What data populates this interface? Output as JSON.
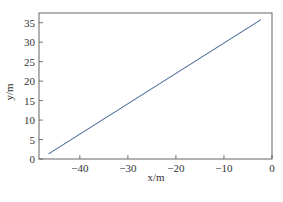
{
  "chart_data": {
    "type": "line",
    "title": "",
    "xlabel": "x/m",
    "ylabel": "y/m",
    "xlim": [
      -48.5,
      0
    ],
    "ylim": [
      0,
      37.5
    ],
    "xticks": [
      -40,
      -30,
      -20,
      -10,
      0
    ],
    "xtick_labels": [
      "−40",
      "−30",
      "−20",
      "−10",
      "0"
    ],
    "yticks": [
      0,
      5,
      10,
      15,
      20,
      25,
      30,
      35
    ],
    "ytick_labels": [
      "0",
      "5",
      "10",
      "15",
      "20",
      "25",
      "30",
      "35"
    ],
    "grid": false,
    "legend": null,
    "series": [
      {
        "name": "trajectory",
        "color": "#4a6a9a",
        "x": [
          -46.5,
          -2.3
        ],
        "y": [
          1.3,
          35.8
        ]
      }
    ]
  }
}
